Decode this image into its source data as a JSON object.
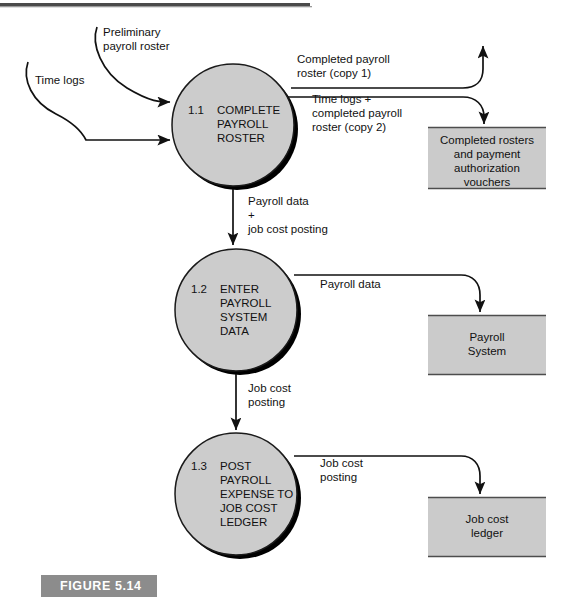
{
  "figure": {
    "caption_label": "FIGURE 5.14",
    "caption_bg": "#8c8c8c",
    "caption_text_color": "#ffffff",
    "top_rule_color": "#4a4a4a"
  },
  "colors": {
    "process_fill": "#cccccc",
    "process_stroke": "#1a1a1a",
    "process_shadow": "#000000",
    "store_fill": "#cbcbcb",
    "store_edge": "#4d4d4d",
    "line": "#111111",
    "background": "#ffffff"
  },
  "processes": [
    {
      "id": "1.1",
      "number": "1.1",
      "lines": [
        "COMPLETE",
        "PAYROLL",
        "ROSTER"
      ],
      "cx": 233,
      "cy": 125,
      "r": 61
    },
    {
      "id": "1.2",
      "number": "1.2",
      "lines": [
        "ENTER",
        "PAYROLL",
        "SYSTEM",
        "DATA"
      ],
      "cx": 236,
      "cy": 310,
      "r": 61
    },
    {
      "id": "1.3",
      "number": "1.3",
      "lines": [
        "POST",
        "PAYROLL",
        "EXPENSE TO",
        "JOB COST",
        "LEDGER"
      ],
      "cx": 236,
      "cy": 494,
      "r": 61
    }
  ],
  "data_stores": [
    {
      "id": "completed-rosters",
      "lines": [
        "Completed rosters",
        "and payment",
        "authorization",
        "vouchers"
      ],
      "x": 428,
      "y": 127,
      "w": 118,
      "h": 62
    },
    {
      "id": "payroll-system",
      "lines": [
        "Payroll",
        "System"
      ],
      "x": 428,
      "y": 315,
      "w": 118,
      "h": 60
    },
    {
      "id": "job-cost-ledger",
      "lines": [
        "Job cost",
        "ledger"
      ],
      "x": 428,
      "y": 497,
      "w": 118,
      "h": 60
    }
  ],
  "flows": [
    {
      "id": "preliminary-payroll-roster",
      "lines": [
        "Preliminary",
        "payroll roster"
      ],
      "label_x": 103,
      "label_y": 36
    },
    {
      "id": "time-logs",
      "lines": [
        "Time logs"
      ],
      "label_x": 35,
      "label_y": 84
    },
    {
      "id": "completed-payroll-roster-copy-1",
      "lines": [
        "Completed payroll",
        "roster (copy 1)"
      ],
      "label_x": 297,
      "label_y": 63
    },
    {
      "id": "time-logs-plus-completed-payroll-roster-copy-2",
      "lines": [
        "Time logs +",
        "completed payroll",
        "roster (copy 2)"
      ],
      "label_x": 312,
      "label_y": 103
    },
    {
      "id": "payroll-data-plus-job-cost-posting",
      "lines": [
        "Payroll data",
        "+",
        "job cost posting"
      ],
      "label_x": 248,
      "label_y": 205
    },
    {
      "id": "payroll-data-to-system",
      "lines": [
        "Payroll data"
      ],
      "label_x": 320,
      "label_y": 288
    },
    {
      "id": "job-cost-posting-down",
      "lines": [
        "Job cost",
        "posting"
      ],
      "label_x": 248,
      "label_y": 392
    },
    {
      "id": "job-cost-posting-to-ledger",
      "lines": [
        "Job cost",
        "posting"
      ],
      "label_x": 320,
      "label_y": 467
    }
  ]
}
